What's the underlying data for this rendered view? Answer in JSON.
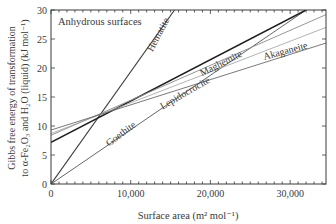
{
  "chart_data": {
    "type": "line",
    "title": "",
    "annotation": "Anhydrous surfaces",
    "xlabel": "Surface area (m² mol⁻¹)",
    "ylabel_line1": "Gibbs free energy of transformation",
    "ylabel_line2": "to α-Fe₂O₃ and H₂O (liquid) (kJ mol⁻¹)",
    "xlim": [
      0,
      34500
    ],
    "ylim": [
      0,
      30
    ],
    "xticks": [
      0,
      10000,
      20000,
      30000
    ],
    "xtick_labels": [
      "0",
      "10,000",
      "20,000",
      "30,000"
    ],
    "yticks": [
      0,
      5,
      10,
      15,
      20,
      25,
      30
    ],
    "ytick_labels": [
      "0",
      "5",
      "10",
      "15",
      "20",
      "25",
      "30"
    ],
    "grid": false,
    "legend": "none (inline line labels)",
    "series": [
      {
        "name": "Hematite",
        "x": [
          0,
          15500
        ],
        "y": [
          0,
          30
        ],
        "color": "#3a3a3a",
        "width": 1.1,
        "label_pos": [
          13800,
          25.5
        ],
        "label_angle": -62
      },
      {
        "name": "Goethite",
        "x": [
          0,
          32000
        ],
        "y": [
          0,
          30
        ],
        "color": "#555555",
        "width": 0.9,
        "label_pos": [
          9000,
          8.2
        ],
        "label_angle": -37
      },
      {
        "name": "Maghemite",
        "x": [
          0,
          32000
        ],
        "y": [
          7.2,
          30
        ],
        "color": "#1e1e1e",
        "width": 1.5,
        "label_pos": [
          21500,
          20.3
        ],
        "label_angle": -27
      },
      {
        "name": "Lepidocrocite",
        "x": [
          0,
          34500
        ],
        "y": [
          8.4,
          29.2
        ],
        "color": "#8a8a8a",
        "width": 0.9,
        "label_pos": [
          17000,
          15.2
        ],
        "label_angle": -30
      },
      {
        "name": "",
        "x": [
          0,
          34500
        ],
        "y": [
          8.7,
          27.0
        ],
        "color": "#a0a0a0",
        "width": 0.8
      },
      {
        "name": "Akaganeite",
        "x": [
          0,
          34500
        ],
        "y": [
          9.3,
          24.3
        ],
        "color": "#6a6a6a",
        "width": 0.9,
        "label_pos": [
          29500,
          22.4
        ],
        "label_angle": -15
      }
    ]
  }
}
